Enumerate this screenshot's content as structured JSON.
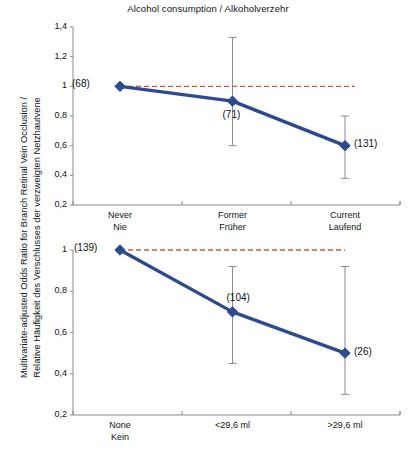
{
  "figure": {
    "title": "Alcohol consumption / Alkoholverzehr",
    "ylabel": "Multivariate-adjusted Odds Ratio for Branch Retinal Vein Occlusion /\nRelative Häufigkeit des Verschlusses der verzweigten Netzhautvene",
    "colors": {
      "series": "#2e4a8f",
      "reference": "#d9523c",
      "axis": "#8a8a8a",
      "errorbar": "#8a8a8a",
      "text": "#111111"
    }
  },
  "chart_data": [
    {
      "type": "line",
      "panel": "top",
      "title": "Alcohol consumption / Alkoholverzehr",
      "xlabel": "",
      "ylabel": "Multivariate-adjusted Odds Ratio for Branch Retinal Vein Occlusion / Relative Häufigkeit des Verschlusses der verzweigten Netzhautvene",
      "categories": [
        "Never\nNie",
        "Former\nFrüher",
        "Current\nLaufend"
      ],
      "categories_en": [
        "Never",
        "Former",
        "Current"
      ],
      "categories_de": [
        "Nie",
        "Früher",
        "Laufend"
      ],
      "values": [
        1.0,
        0.9,
        0.6
      ],
      "ci_lower": [
        1.0,
        0.6,
        0.38
      ],
      "ci_upper": [
        1.0,
        1.33,
        0.8
      ],
      "point_labels": [
        "(68)",
        "(71)",
        "(131)"
      ],
      "counts": [
        68,
        71,
        131
      ],
      "yticks": [
        "1,4",
        "1,2",
        "1",
        "0,8",
        "0,6",
        "0,4",
        "0,2"
      ],
      "ytick_values": [
        1.4,
        1.2,
        1.0,
        0.8,
        0.6,
        0.4,
        0.2
      ],
      "ylim": [
        0.2,
        1.4
      ],
      "reference_line": 1.0,
      "grid": false,
      "legend": "none"
    },
    {
      "type": "line",
      "panel": "bottom",
      "title": "",
      "xlabel": "",
      "ylabel": "",
      "categories": [
        "None\nKein",
        "<29,6 ml",
        ">29,6 ml"
      ],
      "categories_en": [
        "None",
        "<29,6 ml",
        ">29,6 ml"
      ],
      "categories_de": [
        "Kein",
        "<29,6 ml",
        ">29,6 ml"
      ],
      "values": [
        1.0,
        0.7,
        0.5
      ],
      "ci_lower": [
        1.0,
        0.45,
        0.3
      ],
      "ci_upper": [
        1.0,
        0.92,
        0.92
      ],
      "point_labels": [
        "(139)",
        "(104)",
        "(26)"
      ],
      "counts": [
        139,
        104,
        26
      ],
      "yticks": [
        "1",
        "0,8",
        "0,6",
        "0,4",
        "0,2"
      ],
      "ytick_values": [
        1.0,
        0.8,
        0.6,
        0.4,
        0.2
      ],
      "ylim": [
        0.2,
        1.0
      ],
      "reference_line": 1.0,
      "grid": false,
      "legend": "none"
    }
  ]
}
